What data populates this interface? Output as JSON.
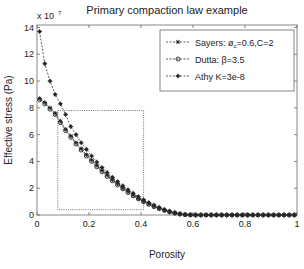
{
  "chart_data": {
    "type": "line",
    "title": "Primary compaction law example",
    "xlabel": "Porosity",
    "ylabel": "Effective stress (Pa)",
    "y_exponent_label": "x 10",
    "y_exponent": "7",
    "xlim": [
      0,
      1
    ],
    "ylim": [
      0,
      14
    ],
    "y_scale_factor": 10000000,
    "xticks": [
      0,
      0.2,
      0.4,
      0.6,
      0.8,
      1
    ],
    "xtick_labels": [
      "0",
      "0.2",
      "0.4",
      "0.6",
      "0.8",
      "1"
    ],
    "yticks": [
      0,
      2,
      4,
      6,
      8,
      10,
      12,
      14
    ],
    "ytick_labels": [
      "0",
      "2",
      "4",
      "6",
      "8",
      "10",
      "12",
      "14"
    ],
    "grid": false,
    "legend_position": "upper right",
    "x": [
      0.01,
      0.03,
      0.05,
      0.07,
      0.09,
      0.11,
      0.13,
      0.15,
      0.17,
      0.19,
      0.21,
      0.23,
      0.25,
      0.27,
      0.29,
      0.31,
      0.33,
      0.35,
      0.37,
      0.39,
      0.41,
      0.43,
      0.45,
      0.47,
      0.49,
      0.51,
      0.53,
      0.55,
      0.57,
      0.59,
      0.61,
      0.63,
      0.65,
      0.67,
      0.69,
      0.71,
      0.73,
      0.75,
      0.77,
      0.79,
      0.81,
      0.83,
      0.85,
      0.87,
      0.89,
      0.91,
      0.93,
      0.95,
      0.97,
      0.99
    ],
    "series": [
      {
        "name": "Sayers: ø_c=0.6,C=2",
        "legend_main": "Sayers: ø",
        "legend_sub": "c",
        "legend_rest": "=0.6,C=2",
        "line_style": "dashed",
        "marker": "star",
        "values": [
          8.7,
          8.4,
          8.0,
          7.6,
          7.0,
          6.4,
          5.9,
          5.4,
          4.95,
          4.5,
          4.1,
          3.7,
          3.33,
          2.97,
          2.63,
          2.32,
          2.02,
          1.74,
          1.48,
          1.24,
          1.02,
          0.82,
          0.64,
          0.48,
          0.34,
          0.22,
          0.12,
          0.05,
          0.01,
          0,
          0,
          0,
          0,
          0,
          0,
          0,
          0,
          0,
          0,
          0,
          0,
          0,
          0,
          0,
          0,
          0,
          0,
          0,
          0,
          0
        ]
      },
      {
        "name": "Dutta: β=3.5",
        "legend_main": "Dutta: β=3.5",
        "line_style": "dashed",
        "marker": "circle",
        "values": [
          8.6,
          8.3,
          7.9,
          7.5,
          6.9,
          6.3,
          5.8,
          5.3,
          4.85,
          4.4,
          4.0,
          3.6,
          3.23,
          2.88,
          2.55,
          2.24,
          1.95,
          1.68,
          1.43,
          1.2,
          0.99,
          0.8,
          0.63,
          0.48,
          0.35,
          0.24,
          0.15,
          0.08,
          0.03,
          0.01,
          0,
          0,
          0,
          0,
          0,
          0,
          0,
          0,
          0,
          0,
          0,
          0,
          0,
          0,
          0,
          0,
          0,
          0,
          0,
          0
        ]
      },
      {
        "name": "Athy K=3e-8",
        "legend_main": "Athy K=3e-8",
        "line_style": "dashed",
        "marker": "asterisk",
        "values": [
          13.7,
          11.3,
          10.0,
          9.0,
          8.3,
          7.5,
          6.6,
          6.0,
          5.4,
          4.9,
          4.4,
          3.95,
          3.55,
          3.17,
          2.82,
          2.49,
          2.18,
          1.89,
          1.62,
          1.37,
          1.14,
          0.93,
          0.74,
          0.57,
          0.42,
          0.29,
          0.18,
          0.09,
          0.03,
          0.01,
          0,
          0,
          0,
          0,
          0,
          0,
          0,
          0,
          0,
          0,
          0,
          0,
          0,
          0,
          0,
          0,
          0,
          0,
          0,
          0
        ]
      }
    ],
    "annotations": [
      {
        "type": "rectangle",
        "style": "dotted",
        "x0": 0.08,
        "x1": 0.41,
        "y0": 0.4,
        "y1": 7.8
      }
    ]
  }
}
